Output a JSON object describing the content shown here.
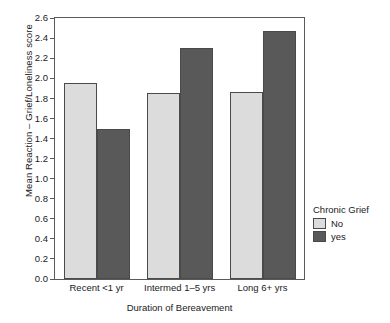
{
  "chart_data": {
    "type": "bar",
    "title": "",
    "xlabel": "Duration of Bereavement",
    "ylabel": "Mean Reaction – Grief/Loneliness score",
    "categories": [
      "Recent <1 yr",
      "Intermed 1–5 yrs",
      "Long 6+ yrs"
    ],
    "series": [
      {
        "name": "No",
        "values": [
          1.95,
          1.85,
          1.86
        ],
        "color": "#dcdcdc"
      },
      {
        "name": "yes",
        "values": [
          1.49,
          2.3,
          2.47
        ],
        "color": "#595959"
      }
    ],
    "ylim": [
      0.0,
      2.6
    ],
    "ytick_labels": [
      "0.0",
      "0.2",
      "0.4",
      "0.6",
      "0.8",
      "1.0",
      "1.2",
      "1.4",
      "1.6",
      "1.8",
      "2.0",
      "2.2",
      "2.4",
      "2.6"
    ],
    "ytick_values": [
      0.0,
      0.2,
      0.4,
      0.6,
      0.8,
      1.0,
      1.2,
      1.4,
      1.6,
      1.8,
      2.0,
      2.2,
      2.4,
      2.6
    ],
    "grid": false,
    "legend": {
      "title": "Chronic Grief",
      "position": "right",
      "entries": [
        {
          "label": "No",
          "color": "#dcdcdc"
        },
        {
          "label": "yes",
          "color": "#595959"
        }
      ]
    },
    "frame_color": "#5a5a5a",
    "bar_edge_color": "#4a4a4a",
    "background": "#ffffff"
  }
}
